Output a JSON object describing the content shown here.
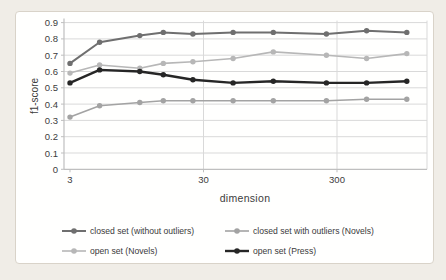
{
  "figure": {
    "page_background": "#f0ede7",
    "panel_background": "#fffffe",
    "panel_border": "#d9d3c9",
    "gridline_color": "#d9d9d9",
    "axis_color": "#bfbfbf",
    "text_color": "#3c3c3c"
  },
  "chart_data": {
    "type": "line",
    "title": "",
    "xlabel": "dimension",
    "ylabel": "f1-score",
    "x_scale": "log",
    "xlim": [
      3,
      1300
    ],
    "ylim": [
      0,
      0.9
    ],
    "grid": "horizontal 0.1 steps; vertical at 30 and 300",
    "legend_position": "bottom, 2 columns",
    "x": [
      3,
      5,
      10,
      15,
      25,
      50,
      100,
      250,
      500,
      1000
    ],
    "x_ticks": [
      {
        "label": "3",
        "value": 3
      },
      {
        "label": "30",
        "value": 30
      },
      {
        "label": "300",
        "value": 300
      }
    ],
    "y_ticks": [
      {
        "label": "0.9",
        "value": 0.9
      },
      {
        "label": "0.8",
        "value": 0.8
      },
      {
        "label": "0.7",
        "value": 0.7
      },
      {
        "label": "0.6",
        "value": 0.6
      },
      {
        "label": "0.5",
        "value": 0.5
      },
      {
        "label": "0.4",
        "value": 0.4
      },
      {
        "label": "0.3",
        "value": 0.3
      },
      {
        "label": "0.2",
        "value": 0.2
      },
      {
        "label": "0.1",
        "value": 0.1
      },
      {
        "label": "0",
        "value": 0
      }
    ],
    "series": [
      {
        "name": "closed set (without outliers)",
        "color": "#6f6f6f",
        "line_width": 2.0,
        "values": [
          0.65,
          0.78,
          0.82,
          0.84,
          0.83,
          0.84,
          0.84,
          0.83,
          0.85,
          0.84
        ]
      },
      {
        "name": "closed set with outliers  (Novels)",
        "color": "#a3a3a3",
        "line_width": 1.6,
        "values": [
          0.32,
          0.39,
          0.41,
          0.42,
          0.42,
          0.42,
          0.42,
          0.42,
          0.43,
          0.43
        ]
      },
      {
        "name": "open set (Novels)",
        "color": "#b7b7b7",
        "line_width": 1.6,
        "values": [
          0.59,
          0.64,
          0.62,
          0.65,
          0.66,
          0.68,
          0.72,
          0.7,
          0.68,
          0.71
        ]
      },
      {
        "name": "open set (Press)",
        "color": "#262626",
        "line_width": 2.4,
        "values": [
          0.53,
          0.61,
          0.6,
          0.58,
          0.55,
          0.53,
          0.54,
          0.53,
          0.53,
          0.54
        ]
      }
    ],
    "legend_order": [
      0,
      1,
      2,
      3
    ]
  }
}
